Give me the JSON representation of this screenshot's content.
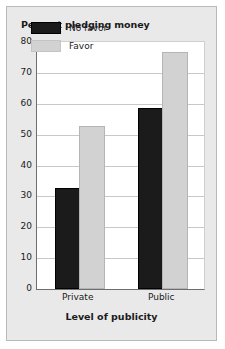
{
  "chart_data": {
    "type": "bar",
    "title": "Percent pledging money",
    "xlabel": "Level of publicity",
    "ylabel": "",
    "categories": [
      "Private",
      "Public"
    ],
    "series": [
      {
        "name": "No favor",
        "values": [
          32,
          58
        ],
        "color": "#1b1b1b"
      },
      {
        "name": "Favor",
        "values": [
          52,
          76
        ],
        "color": "#d2d2d2"
      }
    ],
    "ylim": [
      0,
      80
    ],
    "ytick_step": 10,
    "yticks": [
      0,
      10,
      20,
      30,
      40,
      50,
      60,
      70,
      80
    ],
    "ytick_labels": [
      "0",
      "10",
      "20",
      "30",
      "40",
      "50",
      "60",
      "70",
      "80"
    ],
    "grid": true,
    "grid_axis": "y",
    "legend_position": "top-left-inside"
  },
  "colors": {
    "figure_background": "#e9e9e9",
    "plot_background": "#ffffff",
    "axis": "#6e6e6e",
    "gridline": "#c8c8c8",
    "text": "#1b1b1b",
    "border": "#b9b9b9"
  }
}
